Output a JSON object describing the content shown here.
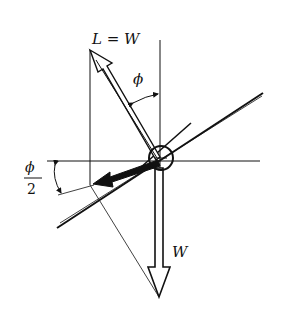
{
  "diagram": {
    "labels": {
      "lift": "L = W",
      "bank_angle": "ϕ",
      "half_angle_num": "ϕ",
      "half_angle_den": "2",
      "weight": "W"
    },
    "colors": {
      "stroke": "#111111",
      "background": "#ffffff"
    }
  }
}
